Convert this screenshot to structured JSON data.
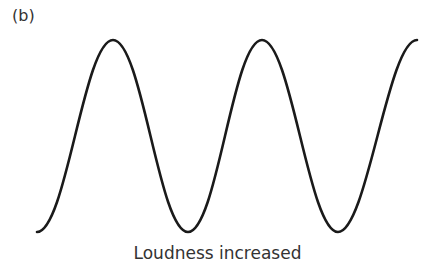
{
  "panel_label": "(b)",
  "caption": "Loudness increased",
  "wave": {
    "description": "sine wave, two full cycles, large amplitude",
    "stroke_color": "#1a1a1a",
    "points": [
      [
        37,
        232
      ],
      [
        113,
        40
      ],
      [
        188,
        232
      ],
      [
        262,
        40
      ],
      [
        338,
        232
      ],
      [
        417,
        40
      ]
    ]
  }
}
